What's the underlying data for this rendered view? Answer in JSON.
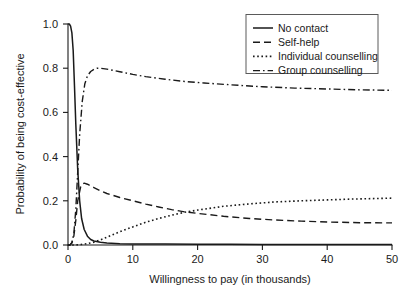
{
  "chart_data": {
    "type": "line",
    "title": "",
    "xlabel": "Willingness to pay (in thousands)",
    "ylabel": "Probability of being cost-effective",
    "xlim": [
      0,
      50
    ],
    "ylim": [
      0,
      1
    ],
    "xticks": [
      0,
      10,
      20,
      30,
      40,
      50
    ],
    "xtick_labels": [
      "0",
      "10",
      "20",
      "30",
      "40",
      "50"
    ],
    "yticks": [
      0.0,
      0.2,
      0.4,
      0.6,
      0.8,
      1.0
    ],
    "ytick_labels": [
      "0.0",
      "0.2",
      "0.4",
      "0.6",
      "0.8",
      "1.0"
    ],
    "grid": false,
    "legend_position": "top-right",
    "series": [
      {
        "name": "No contact",
        "style": "solid",
        "color": "#1a1a1a",
        "x": [
          0,
          0.2,
          0.4,
          0.6,
          0.8,
          1.0,
          1.2,
          1.5,
          1.8,
          2.1,
          2.5,
          3.0,
          3.5,
          4.0,
          5.0,
          6.0,
          8.0,
          10.0,
          15.0,
          20.0,
          25.0,
          30.0,
          35.0,
          40.0,
          45.0,
          50.0
        ],
        "y": [
          1.0,
          1.0,
          0.99,
          0.96,
          0.88,
          0.72,
          0.55,
          0.34,
          0.2,
          0.12,
          0.07,
          0.04,
          0.025,
          0.018,
          0.012,
          0.009,
          0.006,
          0.005,
          0.004,
          0.003,
          0.003,
          0.002,
          0.002,
          0.002,
          0.002,
          0.002
        ]
      },
      {
        "name": "Self-help",
        "style": "dashed",
        "color": "#1a1a1a",
        "x": [
          0,
          0.3,
          0.6,
          0.9,
          1.2,
          1.5,
          2.0,
          2.5,
          3.0,
          4.0,
          5.0,
          6.0,
          8.0,
          10.0,
          12.0,
          14.0,
          16.0,
          18.0,
          20.0,
          24.0,
          28.0,
          32.0,
          36.0,
          40.0,
          45.0,
          50.0
        ],
        "y": [
          0.0,
          0.0,
          0.01,
          0.04,
          0.11,
          0.2,
          0.27,
          0.28,
          0.275,
          0.26,
          0.245,
          0.233,
          0.215,
          0.2,
          0.185,
          0.172,
          0.16,
          0.15,
          0.143,
          0.13,
          0.12,
          0.113,
          0.108,
          0.104,
          0.101,
          0.1
        ]
      },
      {
        "name": "Individual counselling",
        "style": "dotted",
        "color": "#1a1a1a",
        "x": [
          0,
          1.0,
          2.0,
          3.0,
          4.0,
          5.0,
          6.0,
          8.0,
          10.0,
          12.0,
          14.0,
          16.0,
          18.0,
          20.0,
          24.0,
          28.0,
          32.0,
          36.0,
          40.0,
          44.0,
          47.0,
          50.0
        ],
        "y": [
          0.0,
          0.0,
          0.002,
          0.006,
          0.013,
          0.023,
          0.035,
          0.06,
          0.082,
          0.103,
          0.12,
          0.135,
          0.148,
          0.158,
          0.175,
          0.186,
          0.195,
          0.2,
          0.204,
          0.208,
          0.21,
          0.212
        ]
      },
      {
        "name": "Group counselling",
        "style": "dashdot",
        "color": "#1a1a1a",
        "x": [
          0,
          0.3,
          0.6,
          0.9,
          1.2,
          1.5,
          1.8,
          2.2,
          2.6,
          3.0,
          3.5,
          4.0,
          4.5,
          5.0,
          6.0,
          7.0,
          8.0,
          10.0,
          12.0,
          15.0,
          18.0,
          21.0,
          25.0,
          30.0,
          35.0,
          40.0,
          45.0,
          50.0
        ],
        "y": [
          0.0,
          0.0,
          0.01,
          0.05,
          0.16,
          0.33,
          0.5,
          0.65,
          0.73,
          0.765,
          0.785,
          0.795,
          0.8,
          0.8,
          0.796,
          0.79,
          0.784,
          0.772,
          0.762,
          0.75,
          0.74,
          0.733,
          0.725,
          0.716,
          0.71,
          0.706,
          0.702,
          0.7
        ]
      }
    ]
  },
  "legend": {
    "entries": [
      {
        "label": "No contact",
        "style": "solid"
      },
      {
        "label": "Self-help",
        "style": "dashed"
      },
      {
        "label": "Individual counselling",
        "style": "dotted"
      },
      {
        "label": "Group counselling",
        "style": "dashdot"
      }
    ]
  }
}
